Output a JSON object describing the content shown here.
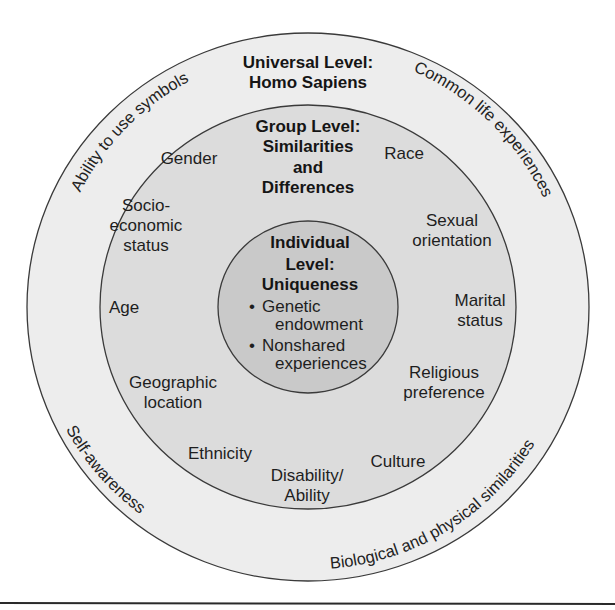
{
  "diagram": {
    "type": "concentric-circles",
    "colors": {
      "outer_ring": "#ededed",
      "middle_ring": "#dcdcdc",
      "inner_circle": "#c9c9c9",
      "stroke": "#3a3a3a",
      "text": "#1e1e1e"
    },
    "universal": {
      "title_line1": "Universal Level:",
      "title_line2": "Homo Sapiens",
      "arc_labels": {
        "top_left": "Ability to use symbols",
        "top_right": "Common life experiences",
        "bottom_left": "Self-awareness",
        "bottom_right": "Biological and physical similarities"
      }
    },
    "group": {
      "title_line1": "Group Level:",
      "title_line2": "Similarities",
      "title_line3": "and",
      "title_line4": "Differences",
      "items": {
        "gender": "Gender",
        "race": "Race",
        "socio_line1": "Socio-",
        "socio_line2": "economic",
        "socio_line3": "status",
        "sexual_line1": "Sexual",
        "sexual_line2": "orientation",
        "age": "Age",
        "marital_line1": "Marital",
        "marital_line2": "status",
        "geo_line1": "Geographic",
        "geo_line2": "location",
        "religious_line1": "Religious",
        "religious_line2": "preference",
        "ethnicity": "Ethnicity",
        "culture": "Culture",
        "disability_line1": "Disability/",
        "disability_line2": "Ability"
      }
    },
    "individual": {
      "title_line1": "Individual",
      "title_line2": "Level:",
      "title_line3": "Uniqueness",
      "bullet_char": "•",
      "bullets": [
        {
          "line1": "Genetic",
          "line2": "endowment"
        },
        {
          "line1": "Nonshared",
          "line2": "experiences"
        }
      ]
    }
  }
}
